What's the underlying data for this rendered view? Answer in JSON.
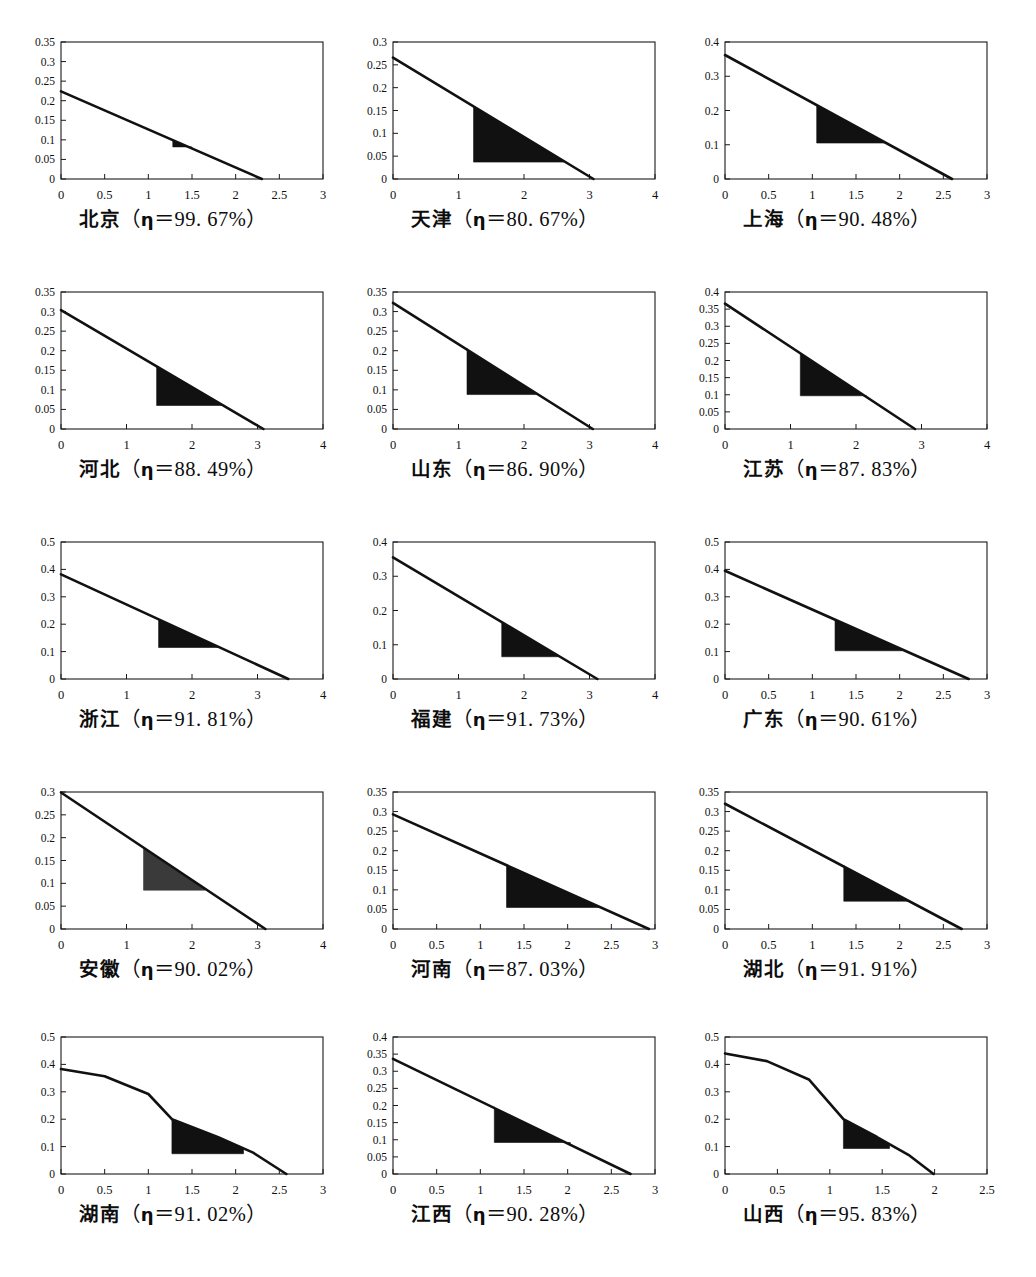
{
  "figure": {
    "kind": "multi-panel-figure",
    "panel_count": 15,
    "rows": 5,
    "columns": 3,
    "eta_symbol": "η",
    "percent_symbol": "%"
  },
  "chart_data": [
    {
      "type": "area",
      "title": "北京（η＝99. 67%）",
      "region": "北京",
      "eta_label": "η＝99. 67%",
      "eta_value": 99.67,
      "xlabel": "",
      "ylabel": "",
      "xlim": [
        0,
        3
      ],
      "ylim": [
        0,
        0.35
      ],
      "xticks": [
        "0",
        "0.5",
        "1",
        "1.5",
        "2",
        "2.5",
        "3"
      ],
      "yticks": [
        "0",
        "0.05",
        "0.1",
        "0.15",
        "0.2",
        "0.25",
        "0.3",
        "0.35"
      ],
      "grid": false,
      "curve": [
        [
          0,
          0.224
        ],
        [
          2.3,
          0.0
        ]
      ],
      "shaded": {
        "x0": 1.28,
        "x1": 1.5,
        "y_floor": 0.082,
        "y_top_left": 0.1,
        "color": "#111111"
      }
    },
    {
      "type": "area",
      "title": "天津（η＝80. 67%）",
      "region": "天津",
      "eta_label": "η＝80. 67%",
      "eta_value": 80.67,
      "xlabel": "",
      "ylabel": "",
      "xlim": [
        0,
        4
      ],
      "ylim": [
        0,
        0.3
      ],
      "xticks": [
        "0",
        "1",
        "2",
        "3",
        "4"
      ],
      "yticks": [
        "0",
        "0.05",
        "0.1",
        "0.15",
        "0.2",
        "0.25",
        "0.3"
      ],
      "grid": false,
      "curve": [
        [
          0,
          0.266
        ],
        [
          3.06,
          0.0
        ]
      ],
      "shaded": {
        "x0": 1.23,
        "x1": 2.62,
        "y_floor": 0.037,
        "y_top_left": 0.159,
        "color": "#111111"
      }
    },
    {
      "type": "area",
      "title": "上海（η＝90. 48%）",
      "region": "上海",
      "eta_label": "η＝90. 48%",
      "eta_value": 90.48,
      "xlabel": "",
      "ylabel": "",
      "xlim": [
        0,
        3
      ],
      "ylim": [
        0,
        0.4
      ],
      "xticks": [
        "0",
        "0.5",
        "1",
        "1.5",
        "2",
        "2.5",
        "3"
      ],
      "yticks": [
        "0",
        "0.1",
        "0.2",
        "0.3",
        "0.4"
      ],
      "grid": false,
      "curve": [
        [
          0,
          0.362
        ],
        [
          2.6,
          0.0
        ]
      ],
      "shaded": {
        "x0": 1.05,
        "x1": 1.83,
        "y_floor": 0.105,
        "y_top_left": 0.216,
        "color": "#111111"
      }
    },
    {
      "type": "area",
      "title": "河北（η＝88.49%）",
      "region": "河北",
      "eta_label": "η＝88.49%",
      "eta_value": 88.49,
      "xlabel": "",
      "ylabel": "",
      "xlim": [
        0,
        4
      ],
      "ylim": [
        0,
        0.35
      ],
      "xticks": [
        "0",
        "1",
        "2",
        "3",
        "4"
      ],
      "yticks": [
        "0",
        "0.05",
        "0.1",
        "0.15",
        "0.2",
        "0.25",
        "0.3",
        "0.35"
      ],
      "grid": false,
      "curve": [
        [
          0,
          0.304
        ],
        [
          3.09,
          0.0
        ]
      ],
      "shaded": {
        "x0": 1.46,
        "x1": 2.48,
        "y_floor": 0.06,
        "y_top_left": 0.16,
        "color": "#111111"
      }
    },
    {
      "type": "area",
      "title": "山东（η＝86.90%）",
      "region": "山东",
      "eta_label": "η＝86.90%",
      "eta_value": 86.9,
      "xlabel": "",
      "ylabel": "",
      "xlim": [
        0,
        4
      ],
      "ylim": [
        0,
        0.35
      ],
      "xticks": [
        "0",
        "1",
        "2",
        "3",
        "4"
      ],
      "yticks": [
        "0",
        "0.05",
        "0.1",
        "0.15",
        "0.2",
        "0.25",
        "0.3",
        "0.35"
      ],
      "grid": false,
      "curve": [
        [
          0,
          0.322
        ],
        [
          3.05,
          0.0
        ]
      ],
      "shaded": {
        "x0": 1.13,
        "x1": 2.21,
        "y_floor": 0.088,
        "y_top_left": 0.206,
        "color": "#111111"
      }
    },
    {
      "type": "area",
      "title": "江苏（η＝87.83%）",
      "region": "江苏",
      "eta_label": "η＝87.83%",
      "eta_value": 87.83,
      "xlabel": "",
      "ylabel": "",
      "xlim": [
        0,
        4
      ],
      "ylim": [
        0,
        0.4
      ],
      "xticks": [
        "0",
        "1",
        "2",
        "3",
        "4"
      ],
      "yticks": [
        "0",
        "0.05",
        "0.1",
        "0.15",
        "0.2",
        "0.25",
        "0.3",
        "0.35",
        "0.4"
      ],
      "grid": false,
      "curve": [
        [
          0,
          0.366
        ],
        [
          2.9,
          0.0
        ]
      ],
      "shaded": {
        "x0": 1.15,
        "x1": 2.16,
        "y_floor": 0.097,
        "y_top_left": 0.221,
        "color": "#111111"
      }
    },
    {
      "type": "area",
      "title": "浙江（η＝91. 81%）",
      "region": "浙江",
      "eta_label": "η＝91. 81%",
      "eta_value": 91.81,
      "xlabel": "",
      "ylabel": "",
      "xlim": [
        0,
        4
      ],
      "ylim": [
        0,
        0.5
      ],
      "xticks": [
        "0",
        "1",
        "2",
        "3",
        "4"
      ],
      "yticks": [
        "0",
        "0.1",
        "0.2",
        "0.3",
        "0.4",
        "0.5"
      ],
      "grid": false,
      "curve": [
        [
          0,
          0.382
        ],
        [
          3.47,
          0.0
        ]
      ],
      "shaded": {
        "x0": 1.49,
        "x1": 2.42,
        "y_floor": 0.115,
        "y_top_left": 0.212,
        "color": "#111111"
      }
    },
    {
      "type": "area",
      "title": "福建（η＝91. 73%）",
      "region": "福建",
      "eta_label": "η＝91. 73%",
      "eta_value": 91.73,
      "xlabel": "",
      "ylabel": "",
      "xlim": [
        0,
        4
      ],
      "ylim": [
        0,
        0.4
      ],
      "xticks": [
        "0",
        "1",
        "2",
        "3",
        "4"
      ],
      "yticks": [
        "0",
        "0.1",
        "0.2",
        "0.3",
        "0.4"
      ],
      "grid": false,
      "curve": [
        [
          0,
          0.355
        ],
        [
          3.12,
          0.0
        ]
      ],
      "shaded": {
        "x0": 1.66,
        "x1": 2.52,
        "y_floor": 0.065,
        "y_top_left": 0.158,
        "color": "#111111"
      }
    },
    {
      "type": "area",
      "title": "广东（η＝90. 61%）",
      "region": "广东",
      "eta_label": "η＝90. 61%",
      "eta_value": 90.61,
      "xlabel": "",
      "ylabel": "",
      "xlim": [
        0,
        3
      ],
      "ylim": [
        0,
        0.5
      ],
      "xticks": [
        "0",
        "0.5",
        "1",
        "1.5",
        "2",
        "2.5",
        "3"
      ],
      "yticks": [
        "0",
        "0.1",
        "0.2",
        "0.3",
        "0.4",
        "0.5"
      ],
      "grid": false,
      "curve": [
        [
          0,
          0.395
        ],
        [
          2.79,
          0.0
        ]
      ],
      "shaded": {
        "x0": 1.26,
        "x1": 2.03,
        "y_floor": 0.103,
        "y_top_left": 0.217,
        "color": "#111111"
      }
    },
    {
      "type": "area",
      "title": "安徽（η＝90. 02%）",
      "region": "安徽",
      "eta_label": "η＝90. 02%",
      "eta_value": 90.02,
      "xlabel": "",
      "ylabel": "",
      "xlim": [
        0,
        4
      ],
      "ylim": [
        0,
        0.3
      ],
      "xticks": [
        "0",
        "1",
        "2",
        "3",
        "4"
      ],
      "yticks": [
        "0",
        "0.05",
        "0.1",
        "0.15",
        "0.2",
        "0.25",
        "0.3"
      ],
      "grid": false,
      "curve": [
        [
          0,
          0.299
        ],
        [
          3.12,
          0.0
        ]
      ],
      "shaded": {
        "x0": 1.26,
        "x1": 2.2,
        "y_floor": 0.085,
        "y_top_left": 0.178,
        "color": "#3a3a3a"
      }
    },
    {
      "type": "area",
      "title": "河南（η＝87.03%）",
      "region": "河南",
      "eta_label": "η＝87.03%",
      "eta_value": 87.03,
      "xlabel": "",
      "ylabel": "",
      "xlim": [
        0,
        3
      ],
      "ylim": [
        0,
        0.35
      ],
      "xticks": [
        "0",
        "0.5",
        "1",
        "1.5",
        "2",
        "2.5",
        "3"
      ],
      "yticks": [
        "0",
        "0.05",
        "0.1",
        "0.15",
        "0.2",
        "0.25",
        "0.3",
        "0.35"
      ],
      "grid": false,
      "curve": [
        [
          0,
          0.293
        ],
        [
          2.93,
          0.0
        ]
      ],
      "shaded": {
        "x0": 1.3,
        "x1": 2.37,
        "y_floor": 0.055,
        "y_top_left": 0.163,
        "color": "#111111"
      }
    },
    {
      "type": "area",
      "title": "湖北（η＝91.91%）",
      "region": "湖北",
      "eta_label": "η＝91.91%",
      "eta_value": 91.91,
      "xlabel": "",
      "ylabel": "",
      "xlim": [
        0,
        3
      ],
      "ylim": [
        0,
        0.35
      ],
      "xticks": [
        "0",
        "0.5",
        "1",
        "1.5",
        "2",
        "2.5",
        "3"
      ],
      "yticks": [
        "0",
        "0.05",
        "0.1",
        "0.15",
        "0.2",
        "0.25",
        "0.3",
        "0.35"
      ],
      "grid": false,
      "curve": [
        [
          0,
          0.32
        ],
        [
          2.71,
          0.0
        ]
      ],
      "shaded": {
        "x0": 1.36,
        "x1": 2.12,
        "y_floor": 0.071,
        "y_top_left": 0.163,
        "color": "#111111"
      }
    },
    {
      "type": "area",
      "title": "湖南（η＝91.02%）",
      "region": "湖南",
      "eta_label": "η＝91.02%",
      "eta_value": 91.02,
      "xlabel": "",
      "ylabel": "",
      "xlim": [
        0,
        3
      ],
      "ylim": [
        0,
        0.5
      ],
      "xticks": [
        "0",
        "0.5",
        "1",
        "1.5",
        "2",
        "2.5",
        "3"
      ],
      "yticks": [
        "0",
        "0.1",
        "0.2",
        "0.3",
        "0.4",
        "0.5"
      ],
      "grid": false,
      "curve": [
        [
          0,
          0.383
        ],
        [
          0.5,
          0.357
        ],
        [
          1.0,
          0.292
        ],
        [
          1.27,
          0.2
        ],
        [
          1.8,
          0.134
        ],
        [
          2.2,
          0.078
        ],
        [
          2.58,
          0.0
        ]
      ],
      "shaded": {
        "x0": 1.27,
        "x1": 2.09,
        "y_floor": 0.074,
        "y_top_left": 0.2,
        "color": "#111111"
      }
    },
    {
      "type": "area",
      "title": "江西（η＝90. 28%）",
      "region": "江西",
      "eta_label": "η＝90. 28%",
      "eta_value": 90.28,
      "xlabel": "",
      "ylabel": "",
      "xlim": [
        0,
        3
      ],
      "ylim": [
        0,
        0.4
      ],
      "xticks": [
        "0",
        "0.5",
        "1",
        "1.5",
        "2",
        "2.5",
        "3"
      ],
      "yticks": [
        "0",
        "0.05",
        "0.1",
        "0.15",
        "0.2",
        "0.25",
        "0.3",
        "0.35",
        "0.4"
      ],
      "grid": false,
      "curve": [
        [
          0,
          0.336
        ],
        [
          2.72,
          0.0
        ]
      ],
      "shaded": {
        "x0": 1.16,
        "x1": 2.03,
        "y_floor": 0.092,
        "y_top_left": 0.196,
        "color": "#111111"
      }
    },
    {
      "type": "area",
      "title": "山西（η＝95.83%）",
      "region": "山西",
      "eta_label": "η＝95.83%",
      "eta_value": 95.83,
      "xlabel": "",
      "ylabel": "",
      "xlim": [
        0,
        2.5
      ],
      "ylim": [
        0,
        0.5
      ],
      "xticks": [
        "0",
        "0.5",
        "1",
        "1.5",
        "2",
        "2.5"
      ],
      "yticks": [
        "0",
        "0.1",
        "0.2",
        "0.3",
        "0.4",
        "0.5"
      ],
      "grid": false,
      "curve": [
        [
          0,
          0.44
        ],
        [
          0.4,
          0.412
        ],
        [
          0.8,
          0.345
        ],
        [
          1.13,
          0.2
        ],
        [
          1.45,
          0.135
        ],
        [
          1.75,
          0.07
        ],
        [
          1.99,
          0.0
        ]
      ],
      "shaded": {
        "x0": 1.13,
        "x1": 1.57,
        "y_floor": 0.093,
        "y_top_left": 0.2,
        "color": "#111111"
      }
    }
  ],
  "panels": [
    {
      "caption_cn": "北京",
      "caption_open": "（",
      "caption_eta": "η",
      "caption_eq": "＝",
      "caption_val": "99. 67%",
      "caption_close": "）"
    },
    {
      "caption_cn": "天津",
      "caption_open": "（",
      "caption_eta": "η",
      "caption_eq": "＝",
      "caption_val": "80. 67%",
      "caption_close": "）"
    },
    {
      "caption_cn": "上海",
      "caption_open": "（",
      "caption_eta": "η",
      "caption_eq": "＝",
      "caption_val": "90. 48%",
      "caption_close": "）"
    },
    {
      "caption_cn": "河北",
      "caption_open": "（",
      "caption_eta": "η",
      "caption_eq": "＝",
      "caption_val": "88. 49%",
      "caption_close": "）"
    },
    {
      "caption_cn": "山东",
      "caption_open": "（",
      "caption_eta": "η",
      "caption_eq": "＝",
      "caption_val": "86. 90%",
      "caption_close": "）"
    },
    {
      "caption_cn": "江苏",
      "caption_open": "（",
      "caption_eta": "η",
      "caption_eq": "＝",
      "caption_val": "87. 83%",
      "caption_close": "）"
    },
    {
      "caption_cn": "浙江",
      "caption_open": "（",
      "caption_eta": "η",
      "caption_eq": "＝",
      "caption_val": "91. 81%",
      "caption_close": "）"
    },
    {
      "caption_cn": "福建",
      "caption_open": "（",
      "caption_eta": "η",
      "caption_eq": "＝",
      "caption_val": "91. 73%",
      "caption_close": "）"
    },
    {
      "caption_cn": "广东",
      "caption_open": "（",
      "caption_eta": "η",
      "caption_eq": "＝",
      "caption_val": "90. 61%",
      "caption_close": "）"
    },
    {
      "caption_cn": "安徽",
      "caption_open": "（",
      "caption_eta": "η",
      "caption_eq": "＝",
      "caption_val": "90. 02%",
      "caption_close": "）"
    },
    {
      "caption_cn": "河南",
      "caption_open": "（",
      "caption_eta": "η",
      "caption_eq": "＝",
      "caption_val": "87. 03%",
      "caption_close": "）"
    },
    {
      "caption_cn": "湖北",
      "caption_open": "（",
      "caption_eta": "η",
      "caption_eq": "＝",
      "caption_val": "91. 91%",
      "caption_close": "）"
    },
    {
      "caption_cn": "湖南",
      "caption_open": "（",
      "caption_eta": "η",
      "caption_eq": "＝",
      "caption_val": "91. 02%",
      "caption_close": "）"
    },
    {
      "caption_cn": "江西",
      "caption_open": "（",
      "caption_eta": "η",
      "caption_eq": "＝",
      "caption_val": "90. 28%",
      "caption_close": "）"
    },
    {
      "caption_cn": "山西",
      "caption_open": "（",
      "caption_eta": "η",
      "caption_eq": "＝",
      "caption_val": "95. 83%",
      "caption_close": "）"
    }
  ]
}
